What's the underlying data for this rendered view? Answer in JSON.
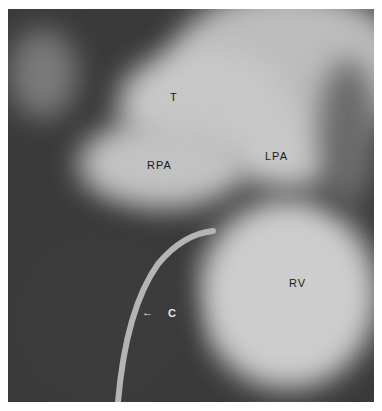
{
  "image": {
    "type": "angiogram",
    "labels": {
      "t": "T",
      "rpa": "RPA",
      "lpa": "LPA",
      "rv": "RV",
      "catheter": "C",
      "catheter_arrow": "←"
    },
    "colors": {
      "background": "#3a3a3a",
      "contrast": "#cfcfcf",
      "label_dark": "#1a1a1a",
      "label_light": "#e8e8e8"
    }
  }
}
